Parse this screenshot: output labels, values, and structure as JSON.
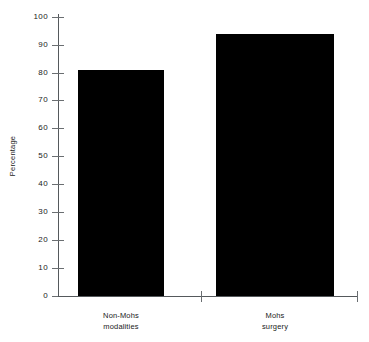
{
  "chart_data": {
    "type": "bar",
    "title": "",
    "xlabel": "",
    "ylabel": "Percentage",
    "ylim": [
      0,
      100
    ],
    "yticks": [
      0,
      10,
      20,
      30,
      40,
      50,
      60,
      70,
      80,
      90,
      100
    ],
    "grid": false,
    "legend": false,
    "bar_color": "#000000",
    "categories": [
      "Non-Mohs modalities",
      "Mohs surgery"
    ],
    "category_lines": [
      [
        "Non-Mohs",
        "modalities"
      ],
      [
        "Mohs",
        "surgery"
      ]
    ],
    "values": [
      81,
      94
    ],
    "series": [
      {
        "name": "Percentage",
        "values": [
          81,
          94
        ]
      }
    ]
  },
  "axis": {
    "y_title": "Percentage",
    "tick_labels": {
      "t100": "100",
      "t90": "90",
      "t80": "80",
      "t70": "70",
      "t60": "60",
      "t50": "50",
      "t40": "40",
      "t30": "30",
      "t20": "20",
      "t10": "10",
      "t0": "0"
    }
  },
  "categories": {
    "cat1_line1": "Non-Mohs",
    "cat1_line2": "modalities",
    "cat2_line1": "Mohs",
    "cat2_line2": "surgery"
  }
}
